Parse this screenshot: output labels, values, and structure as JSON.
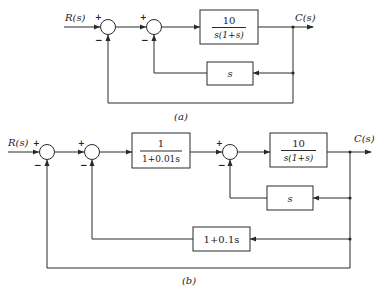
{
  "diagram_a": {
    "caption": "(a)",
    "input_label": "R(s)",
    "output_label": "C(s)",
    "junctions": [
      {
        "plus": "+",
        "minus": "−"
      },
      {
        "plus": "+",
        "minus": "−"
      }
    ],
    "forward_block": {
      "numerator": "10",
      "denominator": "s(1+s)"
    },
    "feedback_block": {
      "label": "s"
    }
  },
  "diagram_b": {
    "caption": "(b)",
    "input_label": "R(s)",
    "output_label": "C(s)",
    "junctions": [
      {
        "plus": "+",
        "minus": "−"
      },
      {
        "plus": "+",
        "minus": "−"
      },
      {
        "plus": "+",
        "minus": "−"
      }
    ],
    "prefilter_block": {
      "numerator": "1",
      "denominator": "1+0.01s"
    },
    "forward_block": {
      "numerator": "10",
      "denominator": "s(1+s)"
    },
    "inner_feedback_block": {
      "label": "s"
    },
    "middle_feedback_block": {
      "label": "1+0.1s"
    }
  }
}
